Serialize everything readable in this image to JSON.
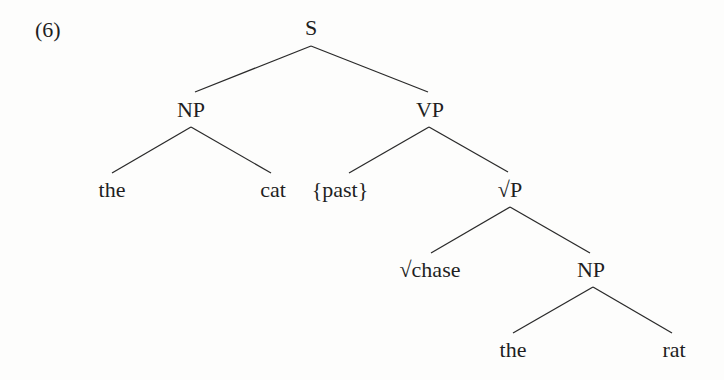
{
  "example_number": "(6)",
  "tree": {
    "root": {
      "label": "S"
    },
    "np_subject": {
      "label": "NP",
      "det": "the",
      "noun": "cat"
    },
    "vp": {
      "label": "VP",
      "tense": "{past}"
    },
    "root_phrase": {
      "label": "√P",
      "root": "√chase"
    },
    "np_object": {
      "label": "NP",
      "det": "the",
      "noun": "rat"
    }
  },
  "colors": {
    "text": "#1f1f1f",
    "edges": "#2a2a2a",
    "background": "#fdfdfc"
  }
}
